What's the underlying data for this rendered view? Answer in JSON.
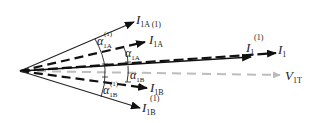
{
  "diagram": {
    "vectors": [
      {
        "id": "I1A1",
        "label_main": "I",
        "label_sub": "1A (1)",
        "label_sup": "",
        "style": "solid"
      },
      {
        "id": "I1A",
        "label_main": "I",
        "label_sub": "1A",
        "label_sup": "",
        "style": "dashed"
      },
      {
        "id": "I1_1",
        "label_main": "I",
        "label_sub": "1",
        "label_sup": "(1)",
        "style": "dashed"
      },
      {
        "id": "I1",
        "label_main": "I",
        "label_sub": "1",
        "label_sup": "",
        "style": "dashed"
      },
      {
        "id": "V1T",
        "label_main": "V",
        "label_sub": "1T",
        "label_sup": "",
        "style": "gray-dashed"
      },
      {
        "id": "I1B",
        "label_main": "I",
        "label_sub": "1B",
        "label_sup": "",
        "style": "dashed"
      },
      {
        "id": "I1B1",
        "label_main": "I",
        "label_sub": "1B",
        "label_sup": "(1)",
        "style": "solid"
      }
    ],
    "angles": [
      {
        "id": "a1A1",
        "label_main": "α",
        "label_sub": "1A",
        "label_sup": "(1)"
      },
      {
        "id": "a1A",
        "label_main": "α",
        "label_sub": "1A",
        "label_sup": ""
      },
      {
        "id": "a1B",
        "label_main": "α",
        "label_sub": "1B",
        "label_sup": ""
      },
      {
        "id": "a1B1",
        "label_main": "α",
        "label_sub": "1B",
        "label_sup": "(1)"
      }
    ]
  }
}
